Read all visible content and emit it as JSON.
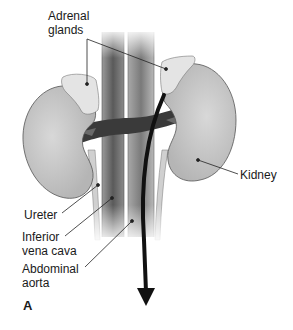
{
  "figure": {
    "panel_letter": "A",
    "labels": {
      "adrenal_glands": "Adrenal\nglands",
      "kidney": "Kidney",
      "ureter": "Ureter",
      "inferior_vena_cava": "Inferior\nvena cava",
      "abdominal_aorta": "Abdominal\naorta"
    }
  },
  "colors": {
    "kidney_fill": "#c4c4c4",
    "kidney_highlight": "#dcdcdc",
    "adrenal_fill": "#e6e6e6",
    "vessel_dark": "#3a3a3a",
    "vessel_mid": "#8a8a8a",
    "ureter_fill": "#d9d9d9",
    "arrow": "#111111",
    "leader_line": "#222222"
  }
}
